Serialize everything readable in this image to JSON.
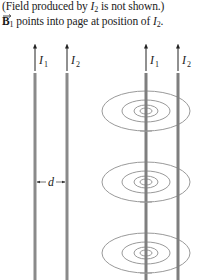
{
  "caption": {
    "line1_prefix": "(Field produced by ",
    "line1_var": "I",
    "line1_sub": "2",
    "line1_suffix": " is not shown.)",
    "line2_vector": "B",
    "line2_vector_sub": "1",
    "line2_text": " points into page at position of ",
    "line2_var": "I",
    "line2_sub": "2",
    "line2_end": "."
  },
  "left_diagram": {
    "wires": [
      {
        "label": "I",
        "sub": "1"
      },
      {
        "label": "I",
        "sub": "2"
      }
    ],
    "separation_label": "d"
  },
  "right_diagram": {
    "wires": [
      {
        "label": "I",
        "sub": "1"
      },
      {
        "label": "I",
        "sub": "2"
      }
    ],
    "field_loops": 3
  },
  "colors": {
    "wire": "#8a8a8a",
    "field_line": "#9a9a9a",
    "text": "#1a1a1a"
  }
}
